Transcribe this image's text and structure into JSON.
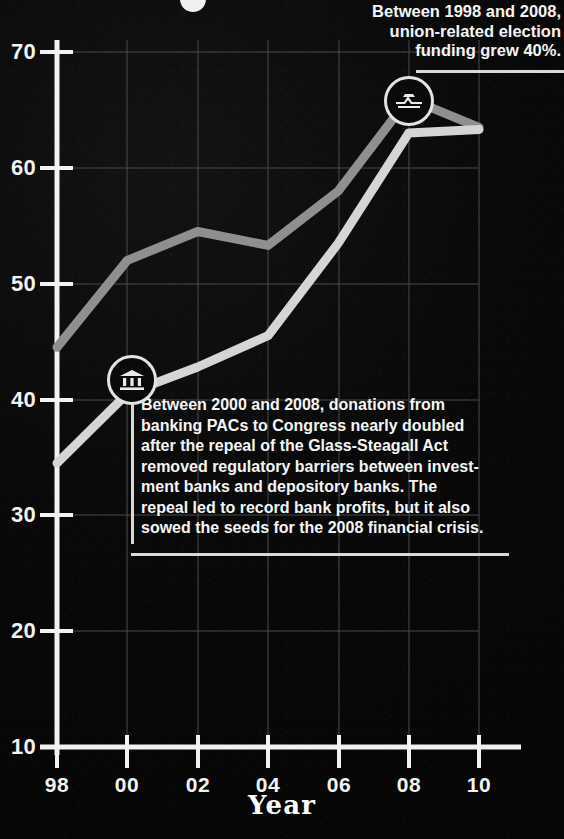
{
  "chart_data": {
    "type": "line",
    "title": "",
    "xlabel": "Year",
    "ylabel": "",
    "xlim": [
      1998,
      2010
    ],
    "ylim": [
      10,
      72
    ],
    "x": [
      1998,
      1999,
      2000,
      2001,
      2002,
      2003,
      2004,
      2005,
      2006,
      2007,
      2008,
      2009,
      2010
    ],
    "x_tick_labels": [
      "98",
      "00",
      "02",
      "04",
      "06",
      "08",
      "10"
    ],
    "x_tick_values": [
      1998,
      2000,
      2002,
      2004,
      2006,
      2008,
      2010
    ],
    "y_tick_labels": [
      "10",
      "20",
      "30",
      "40",
      "50",
      "60",
      "70"
    ],
    "y_tick_values": [
      10,
      20,
      30,
      40,
      50,
      60,
      70
    ],
    "grid": true,
    "legend": "none",
    "series": [
      {
        "name": "union-related election funding",
        "color": "#8f8f8f",
        "x": [
          1998,
          2000,
          2002,
          2004,
          2006,
          2008,
          2010
        ],
        "values": [
          44.5,
          52.0,
          54.5,
          53.3,
          58.0,
          66.0,
          63.5
        ]
      },
      {
        "name": "banking PAC donations to Congress",
        "color": "#d5d5d5",
        "x": [
          1998,
          2000,
          2002,
          2004,
          2006,
          2008,
          2010
        ],
        "values": [
          34.5,
          40.5,
          42.8,
          45.5,
          53.5,
          63.0,
          63.3
        ]
      }
    ],
    "annotations": [
      {
        "id": "union-note",
        "text": "Between 1998 and 2008, union-related election funding grew 40%.",
        "lines": [
          "Between 1998 and 2008,",
          "union-related election",
          "funding grew 40%."
        ],
        "marker_icon": "union-handshake-icon",
        "marker_x": 2007,
        "marker_y": 65.6
      },
      {
        "id": "bank-note",
        "text": "Between 2000 and 2008, donations from banking PACs to Congress nearly doubled after the repeal of the Glass-Steagall Act removed regulatory barriers between investment banks and depository banks. The repeal led to record bank profits, but it also sowed the seeds for the 2008 financial crisis.",
        "lines": [
          "Between 2000 and 2008, donations from",
          "banking PACs to Congress nearly doubled",
          "after the repeal of the Glass-Steagall Act",
          "removed regulatory barriers between invest-",
          "ment banks and depository banks. The",
          "repeal led to record bank profits, but it also",
          "sowed the seeds for the 2008 financial crisis."
        ],
        "marker_icon": "bank-building-icon",
        "marker_x": 2000.8,
        "marker_y": 41.0
      }
    ]
  },
  "axis": {
    "x_title": "Year",
    "y_ticks": [
      "70",
      "60",
      "50",
      "40",
      "30",
      "20",
      "10"
    ],
    "x_ticks": [
      "98",
      "00",
      "02",
      "04",
      "06",
      "08",
      "10"
    ]
  },
  "colors": {
    "background": "#050505",
    "axis": "#f2f2f2",
    "grid": "#4a4a4a",
    "series_union": "#8f8f8f",
    "series_bank": "#d5d5d5",
    "text": "#f5f5f5"
  }
}
